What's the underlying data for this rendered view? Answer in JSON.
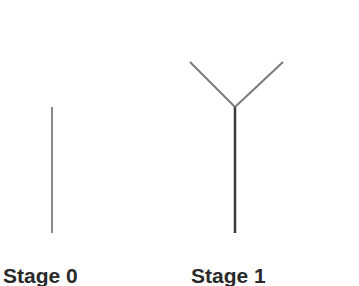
{
  "stages": [
    {
      "label": "Stage 0",
      "segments": [
        {
          "x1": 52,
          "y1": 107,
          "x2": 52,
          "y2": 233,
          "color": "#8a8a8a",
          "width": 2
        }
      ]
    },
    {
      "label": "Stage 1",
      "segments": [
        {
          "x1": 235,
          "y1": 107,
          "x2": 235,
          "y2": 233,
          "color": "#3a3a3a",
          "width": 2.5
        },
        {
          "x1": 235,
          "y1": 107,
          "x2": 190,
          "y2": 62,
          "color": "#7a7a7a",
          "width": 2
        },
        {
          "x1": 235,
          "y1": 107,
          "x2": 283,
          "y2": 62,
          "color": "#7a7a7a",
          "width": 2
        }
      ]
    }
  ]
}
